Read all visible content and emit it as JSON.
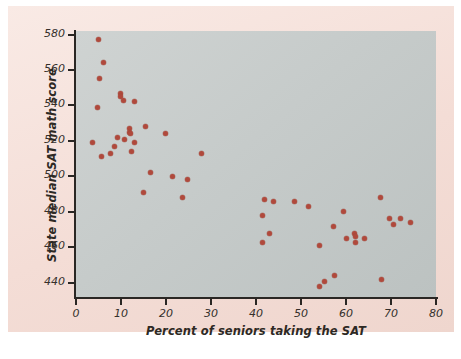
{
  "chart_data": {
    "type": "scatter",
    "title": "",
    "xlabel": "Percent of seniors taking the SAT",
    "ylabel": "State median SAT math score",
    "xlim": [
      0,
      80
    ],
    "ylim": [
      432,
      582
    ],
    "grid": false,
    "legend": null,
    "marker_color": "#b0493c",
    "plot_background": "#c6cbca",
    "figure_background": "#f4ddd6",
    "xticks": [
      0,
      10,
      20,
      30,
      40,
      50,
      60,
      70,
      80
    ],
    "xtick_labels": [
      "0",
      "10",
      "20",
      "30",
      "40",
      "50",
      "60",
      "70",
      "80"
    ],
    "yticks": [
      440,
      460,
      480,
      500,
      520,
      540,
      560,
      580
    ],
    "ytick_labels": [
      "440",
      "460",
      "480",
      "500",
      "520",
      "540",
      "560",
      "580"
    ],
    "points": [
      {
        "x": 4.9,
        "y": 577
      },
      {
        "x": 6.2,
        "y": 564
      },
      {
        "x": 5.3,
        "y": 555
      },
      {
        "x": 4.7,
        "y": 539
      },
      {
        "x": 9.8,
        "y": 547
      },
      {
        "x": 9.9,
        "y": 545
      },
      {
        "x": 10.6,
        "y": 543
      },
      {
        "x": 13.1,
        "y": 542
      },
      {
        "x": 15.5,
        "y": 528
      },
      {
        "x": 11.8,
        "y": 527
      },
      {
        "x": 11.9,
        "y": 525
      },
      {
        "x": 12.0,
        "y": 524
      },
      {
        "x": 19.8,
        "y": 524
      },
      {
        "x": 9.2,
        "y": 522
      },
      {
        "x": 10.7,
        "y": 521
      },
      {
        "x": 3.6,
        "y": 519
      },
      {
        "x": 12.9,
        "y": 519
      },
      {
        "x": 8.5,
        "y": 517
      },
      {
        "x": 27.8,
        "y": 513
      },
      {
        "x": 12.3,
        "y": 514
      },
      {
        "x": 7.7,
        "y": 513
      },
      {
        "x": 5.7,
        "y": 511
      },
      {
        "x": 16.6,
        "y": 502
      },
      {
        "x": 21.5,
        "y": 500
      },
      {
        "x": 24.8,
        "y": 498
      },
      {
        "x": 14.9,
        "y": 491
      },
      {
        "x": 23.6,
        "y": 488
      },
      {
        "x": 41.9,
        "y": 487
      },
      {
        "x": 43.9,
        "y": 486
      },
      {
        "x": 48.6,
        "y": 486
      },
      {
        "x": 67.7,
        "y": 488
      },
      {
        "x": 51.7,
        "y": 483
      },
      {
        "x": 59.5,
        "y": 480
      },
      {
        "x": 41.5,
        "y": 478
      },
      {
        "x": 69.6,
        "y": 476
      },
      {
        "x": 72.0,
        "y": 476
      },
      {
        "x": 74.3,
        "y": 474
      },
      {
        "x": 70.6,
        "y": 473
      },
      {
        "x": 57.3,
        "y": 472
      },
      {
        "x": 43.0,
        "y": 468
      },
      {
        "x": 61.9,
        "y": 468
      },
      {
        "x": 62.2,
        "y": 466
      },
      {
        "x": 64.1,
        "y": 465
      },
      {
        "x": 60.0,
        "y": 465
      },
      {
        "x": 62.0,
        "y": 463
      },
      {
        "x": 41.4,
        "y": 463
      },
      {
        "x": 54.0,
        "y": 461
      },
      {
        "x": 57.4,
        "y": 444
      },
      {
        "x": 67.9,
        "y": 442
      },
      {
        "x": 55.2,
        "y": 441
      },
      {
        "x": 54.0,
        "y": 438
      }
    ]
  }
}
